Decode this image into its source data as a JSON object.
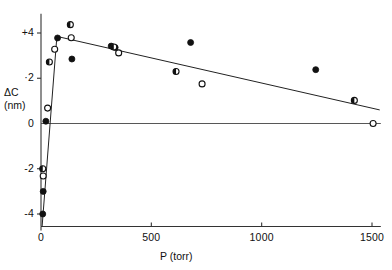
{
  "chart_data": {
    "type": "scatter",
    "title": "",
    "xlabel": "P  (torr)",
    "ylabel_line1": "ΔC",
    "ylabel_line2": "(nm)",
    "xlim": [
      0,
      1540
    ],
    "ylim": [
      -4.6,
      4.9
    ],
    "xticks": [
      0,
      500,
      1000,
      1500
    ],
    "xtick_labels": [
      "0",
      "500",
      "1000",
      "1500"
    ],
    "yticks": [
      4,
      2,
      0,
      -2,
      -4
    ],
    "ytick_labels": [
      "+4",
      "·2",
      "0",
      "-2",
      "-4"
    ],
    "grid": false,
    "legend": "none",
    "zero_line": {
      "y": 0,
      "from_x": 0,
      "to_x": 1540
    },
    "series": [
      {
        "name": "filled-circle",
        "marker": "filled",
        "points": [
          {
            "x": 8,
            "y": -4.0
          },
          {
            "x": 10,
            "y": -3.0
          },
          {
            "x": 22,
            "y": 0.1
          },
          {
            "x": 75,
            "y": 3.78
          },
          {
            "x": 140,
            "y": 2.85
          },
          {
            "x": 318,
            "y": 3.42
          },
          {
            "x": 336,
            "y": 3.36
          },
          {
            "x": 678,
            "y": 3.58
          },
          {
            "x": 1245,
            "y": 2.38
          }
        ]
      },
      {
        "name": "open-circle",
        "marker": "open",
        "points": [
          {
            "x": 10,
            "y": -2.32
          },
          {
            "x": 30,
            "y": 0.68
          },
          {
            "x": 62,
            "y": 3.28
          },
          {
            "x": 137,
            "y": 3.79
          },
          {
            "x": 352,
            "y": 3.12
          },
          {
            "x": 730,
            "y": 1.75
          },
          {
            "x": 1505,
            "y": 0.0
          }
        ]
      },
      {
        "name": "half-filled-circle",
        "marker": "half",
        "points": [
          {
            "x": 8,
            "y": -2.0
          },
          {
            "x": 38,
            "y": 2.72
          },
          {
            "x": 133,
            "y": 4.37
          },
          {
            "x": 330,
            "y": 3.38
          },
          {
            "x": 612,
            "y": 2.3
          },
          {
            "x": 1420,
            "y": 1.02
          }
        ]
      }
    ],
    "fit_lines": [
      {
        "name": "rising-segment",
        "x1": 5,
        "y1": -4.55,
        "x2": 72,
        "y2": 3.85
      },
      {
        "name": "declining-segment",
        "x1": 72,
        "y1": 3.85,
        "x2": 1535,
        "y2": 0.6
      }
    ]
  }
}
